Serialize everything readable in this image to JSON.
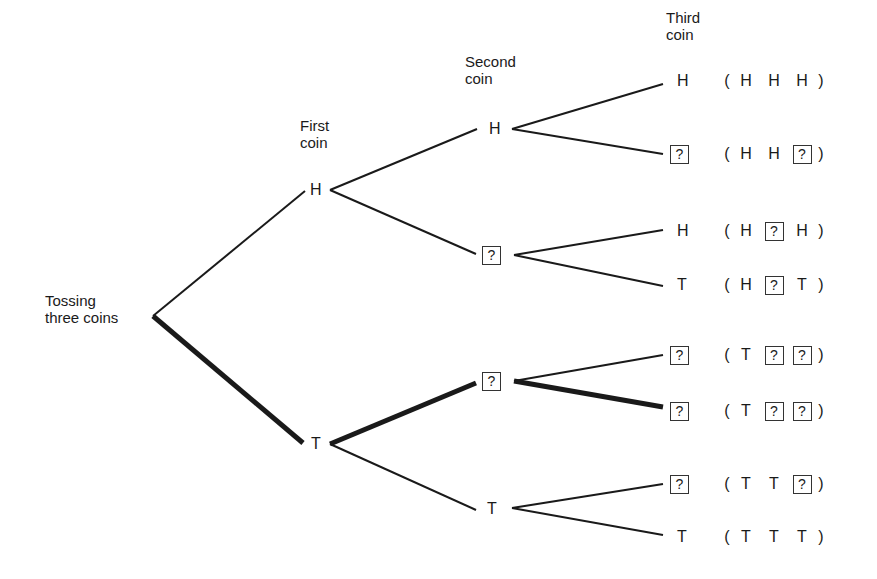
{
  "headers": {
    "first_coin": "First\ncoin",
    "second_coin": "Second\ncoin",
    "third_coin": "Third\ncoin"
  },
  "root": {
    "label": "Tossing\nthree coins"
  },
  "first_coin": [
    {
      "id": "H",
      "label": "H"
    },
    {
      "id": "T",
      "label": "T"
    }
  ],
  "second_coin": [
    {
      "parent": "H",
      "label": "H"
    },
    {
      "parent": "H",
      "label": "?",
      "boxed": true
    },
    {
      "parent": "T",
      "label": "?",
      "boxed": true
    },
    {
      "parent": "T",
      "label": "T"
    }
  ],
  "third_coin": [
    {
      "label": "H",
      "boxed": false
    },
    {
      "label": "?",
      "boxed": true
    },
    {
      "label": "H",
      "boxed": false
    },
    {
      "label": "T",
      "boxed": false
    },
    {
      "label": "?",
      "boxed": true
    },
    {
      "label": "?",
      "boxed": true
    },
    {
      "label": "?",
      "boxed": true
    },
    {
      "label": "T",
      "boxed": false
    }
  ],
  "outcomes": [
    {
      "open": "(",
      "c1": "H",
      "c2": "H",
      "c3": "H",
      "close": ")"
    },
    {
      "open": "(",
      "c1": "H",
      "c2": "H",
      "c3": "?",
      "close": ")"
    },
    {
      "open": "(",
      "c1": "H",
      "c2": "?",
      "c3": "H",
      "close": ")"
    },
    {
      "open": "(",
      "c1": "H",
      "c2": "?",
      "c3": "T",
      "close": ")"
    },
    {
      "open": "(",
      "c1": "T",
      "c2": "?",
      "c3": "?",
      "close": ")"
    },
    {
      "open": "(",
      "c1": "T",
      "c2": "?",
      "c3": "?",
      "close": ")"
    },
    {
      "open": "(",
      "c1": "T",
      "c2": "T",
      "c3": "?",
      "close": ")"
    },
    {
      "open": "(",
      "c1": "T",
      "c2": "T",
      "c3": "T",
      "close": ")"
    }
  ],
  "highlighted_path": [
    "root",
    "T",
    "?",
    "?"
  ],
  "colors": {
    "line": "#1a1a1a",
    "background": "#ffffff"
  }
}
